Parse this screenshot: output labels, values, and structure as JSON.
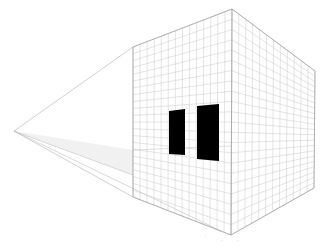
{
  "diagram": {
    "type": "two-point perspective grid cube",
    "vanishing_point_left": {
      "x": 14,
      "y": 131
    },
    "front_edge": {
      "top": {
        "x": 232,
        "y": 9
      },
      "bottom": {
        "x": 231,
        "y": 235
      }
    },
    "left_face": {
      "top": {
        "x": 133,
        "y": 47
      },
      "bottom": {
        "x": 133,
        "y": 197
      }
    },
    "right_face": {
      "top": {
        "x": 315,
        "y": 71
      },
      "bottom": {
        "x": 314,
        "y": 188
      }
    },
    "horizon_y": 175,
    "grid_rows": 22,
    "grid_cols_left": 14,
    "grid_cols_right": 12,
    "windows": [
      {
        "points": "169,111 185,109 185,155 169,154"
      },
      {
        "points": "197,106 219,104 219,161 197,159"
      }
    ],
    "colors": {
      "grid": "#c8c8c8",
      "edge": "#9a9a9a",
      "window": "#000000",
      "guide": "#b0b0b0"
    },
    "labels": [
      {
        "text": "·",
        "x": 205,
        "y": 234
      },
      {
        "text": "·",
        "x": 221,
        "y": 238
      },
      {
        "text": "·",
        "x": 237,
        "y": 238
      }
    ]
  }
}
